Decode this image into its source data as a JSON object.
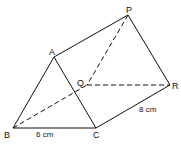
{
  "diagram": {
    "type": "triangular-prism",
    "vertices": {
      "A": {
        "label": "A"
      },
      "P": {
        "label": "P"
      },
      "Q": {
        "label": "Q"
      },
      "R": {
        "label": "R"
      },
      "B": {
        "label": "B"
      },
      "C": {
        "label": "C"
      }
    },
    "edges": {
      "solid": [
        "AB",
        "AC",
        "BC",
        "AP",
        "CR",
        "PR"
      ],
      "dashed": [
        "BQ",
        "QR",
        "PQ"
      ]
    },
    "measurements": {
      "BC": "6 cm",
      "CR": "8 cm"
    }
  }
}
